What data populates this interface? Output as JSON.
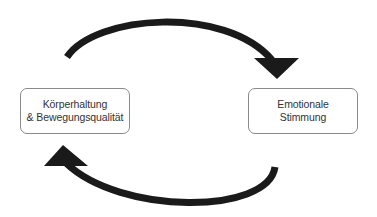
{
  "diagram": {
    "type": "cycle",
    "nodes": [
      {
        "id": "left",
        "lines": [
          "Körperhaltung",
          "& Bewegungsqualität"
        ]
      },
      {
        "id": "right",
        "lines": [
          "Emotionale",
          "Stimmung"
        ]
      }
    ],
    "edges": [
      {
        "from": "left",
        "to": "right",
        "path": "top-arc",
        "icon": "curved-arrow-right-icon"
      },
      {
        "from": "right",
        "to": "left",
        "path": "bottom-arc",
        "icon": "curved-arrow-left-icon"
      }
    ],
    "colors": {
      "arrow": "#1a1a1a",
      "box_border": "#8a8a8a",
      "text": "#333333",
      "background": "#ffffff"
    }
  }
}
